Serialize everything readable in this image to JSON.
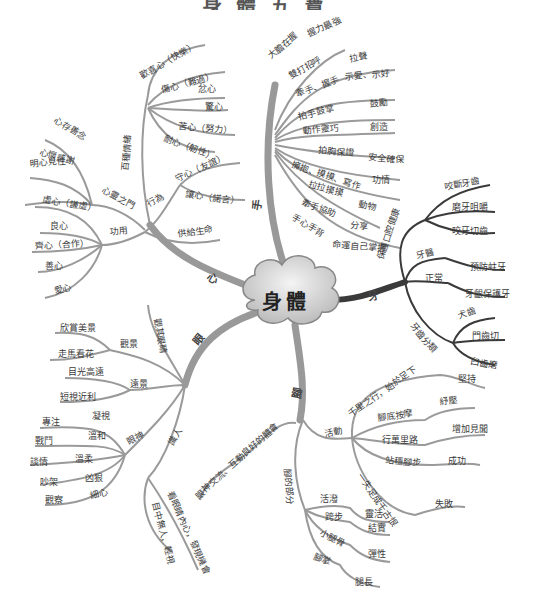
{
  "title": "身體五寶",
  "center": {
    "label": "身體"
  },
  "branches": {
    "heart": {
      "label": "心",
      "children": {
        "emotions": {
          "label": "百種情緒",
          "items": [
            "歡喜心（快樂）",
            "傷心（難過）",
            "忿心",
            "驚心",
            "苦心（努力）",
            "耐心（韌性）"
          ]
        },
        "conduct": {
          "label": "行為",
          "items": [
            "守心（友誼）",
            "讓心（諾言）"
          ]
        },
        "life": {
          "label": "供給生命"
        },
        "spirit": {
          "label": "心靈之門",
          "items": [
            "心存善念",
            "心懷感謝",
            "明心見性"
          ]
        },
        "function": {
          "label": "功用",
          "items": [
            "虛心（謙虛）",
            "良心",
            "齊心（合作）",
            "善心",
            "愛心"
          ]
        }
      }
    },
    "hands": {
      "label": "手",
      "items": [
        {
          "a": "大膽在握",
          "b": "握力最強"
        },
        {
          "a": "雙打招呼",
          "b": "拉聲"
        },
        {
          "a": "牽手、握手",
          "b": "示愛、示好"
        },
        {
          "a": "拍手鼓掌",
          "b": "鼓勵"
        },
        {
          "a": "動作靈巧",
          "b": "創造"
        },
        {
          "a": "拍胸保證",
          "b": "安全確保"
        },
        {
          "a": "擁抱、摸摸、寫作",
          "b": "功情"
        },
        {
          "a": "拉拉摸摸",
          "b": "動物"
        },
        {
          "a": "牽手協助",
          "b": "分享"
        },
        {
          "a": "手心手背",
          "b": "命運自己掌握"
        }
      ]
    },
    "teeth": {
      "label": "牙",
      "children": [
        {
          "label": "保護口腔健康",
          "items": [
            "咬斷牙齒",
            "磨牙咀嚼",
            "咬牙切齒"
          ]
        },
        {
          "label": "牙醫",
          "items": [
            "預防蛀牙"
          ]
        },
        {
          "label": "正常",
          "items": [
            "牙齦保護牙"
          ]
        },
        {
          "label": "牙齒分類",
          "items": [
            "犬齒",
            "門齒切",
            "臼齒磨"
          ]
        }
      ]
    },
    "eyes": {
      "label": "眼",
      "children": {
        "view": {
          "label": "觀景",
          "items": [
            "欣賞美景",
            "走馬看花"
          ]
        },
        "story": {
          "label": "遠景",
          "items": [
            "目光高遠",
            "短視近利"
          ]
        },
        "expression": {
          "label": "眼神",
          "items": [
            {
              "a": "凝視",
              "b": "專注"
            },
            {
              "a": "溫和",
              "b": "戰鬥"
            },
            {
              "a": "溫柔",
              "b": "談情"
            },
            {
              "a": "凶狠",
              "b": "吵架"
            },
            {
              "a": "細心",
              "b": "觀察"
            }
          ]
        },
        "people": {
          "label": "識人"
        },
        "see": {
          "label": "觀其眼睛",
          "items": [
            "看眼睛內心，發現機會",
            "目中無人，輕視"
          ]
        },
        "eye_contact": {
          "label": "眼神交流、互動良好的體會"
        }
      }
    },
    "feet": {
      "label": "腳",
      "children": {
        "activity": {
          "label": "活動",
          "items": [
            {
              "a": "千里之行，始於足下",
              "b": "堅持"
            },
            {
              "a": "腳底按摩",
              "b": "紓壓"
            },
            {
              "a": "行萬里路",
              "b": "增加見聞"
            },
            {
              "a": "站穩腳步",
              "b": "成功"
            },
            {
              "a": "一失足成千古恨",
              "b": "失敗"
            }
          ]
        },
        "parts": {
          "label": "腳的部分",
          "items": [
            {
              "a": "活潑",
              "b": "靈活"
            },
            {
              "a": "跨步",
              "b": "結實"
            },
            {
              "a": "小腿骨",
              "b": "彈性"
            },
            {
              "a": "腳掌",
              "b": "腿長"
            }
          ]
        }
      }
    }
  },
  "colors": {
    "branch_gray": "#9a9a9a",
    "branch_dark": "#3a3a3a",
    "cloud_fill": "#d8d8d8",
    "cloud_stroke": "#888888",
    "text": "#3a3a3a"
  }
}
